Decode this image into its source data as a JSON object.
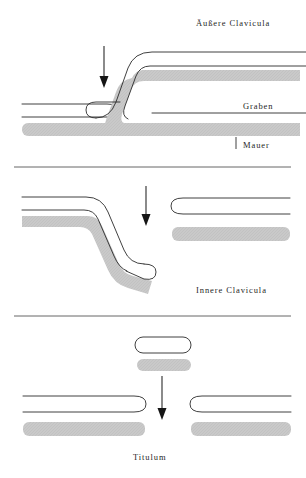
{
  "figure": {
    "type": "diagram",
    "background_color": "#ffffff",
    "outline_color": "#1a1a1a",
    "shadow_fill_color": "#c8c8c8",
    "rule_color": "#555555",
    "width": 306,
    "height": 478
  },
  "panels": [
    {
      "id": "panel-aussere",
      "title": "Äußere  Clavicula",
      "annotations": [
        {
          "id": "graben",
          "label": "Graben"
        },
        {
          "id": "mauer",
          "label": "Mauer"
        }
      ],
      "arrow": {
        "direction": "down",
        "x": 104,
        "y_start": 46,
        "y_end": 86
      },
      "elements": [
        {
          "name": "left-bar",
          "shape": "rounded-right-bar",
          "shadow": true
        },
        {
          "name": "s-curve-bar",
          "shape": "s-curve",
          "shadow": true
        }
      ]
    },
    {
      "id": "panel-innere",
      "title": "Innere  Clavicula",
      "annotations": [],
      "arrow": {
        "direction": "down",
        "x": 146,
        "y_start": 186,
        "y_end": 228
      },
      "elements": [
        {
          "name": "s-curve-bar",
          "shape": "s-curve-mirrored",
          "shadow": true
        },
        {
          "name": "right-bar",
          "shape": "rounded-left-bar",
          "shadow": true
        }
      ]
    },
    {
      "id": "panel-titulum",
      "title": "Titulum",
      "annotations": [],
      "arrow": {
        "direction": "down",
        "x": 162,
        "y_start": 376,
        "y_end": 420
      },
      "elements": [
        {
          "name": "small-block",
          "shape": "rounded-rect",
          "shadow": true
        },
        {
          "name": "left-bar",
          "shape": "rounded-right-bar",
          "shadow": true
        },
        {
          "name": "right-bar",
          "shape": "rounded-left-bar",
          "shadow": true
        }
      ]
    }
  ],
  "separators": [
    {
      "id": "separator-1",
      "y": 167
    },
    {
      "id": "separator-2",
      "y": 316
    }
  ]
}
